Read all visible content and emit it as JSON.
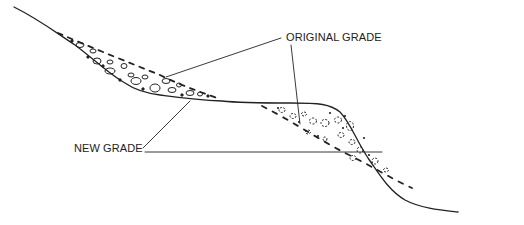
{
  "diagram": {
    "type": "cross-section",
    "labels": {
      "original_grade": "ORIGINAL GRADE",
      "new_grade": "NEW GRADE"
    },
    "colors": {
      "line": "#222222",
      "background": "#ffffff"
    }
  }
}
